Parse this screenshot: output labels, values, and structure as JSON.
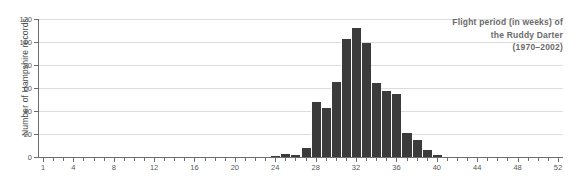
{
  "chart_data": {
    "type": "bar",
    "title": "Flight period (in weeks) of the Ruddy Darter (1970–2002)",
    "title_lines": [
      "Flight period (in weeks) of",
      "the Ruddy Darter",
      "(1970–2002)"
    ],
    "xlabel": "",
    "ylabel": "Number of Hampshire records",
    "xlim": [
      0.5,
      52.5
    ],
    "ylim": [
      0,
      120
    ],
    "grid": true,
    "legend": false,
    "bar_color": "#3b3b3b",
    "axis_color": "#6d6d6d",
    "grid_color": "#dcdcdc",
    "title_color": "#6a6a6a",
    "ytick_values": [
      0,
      20,
      40,
      60,
      80,
      100,
      120
    ],
    "ytick_labels": [
      "0",
      "20",
      "40",
      "60",
      "80",
      "100",
      "120"
    ],
    "xtick_values": [
      1,
      4,
      8,
      12,
      16,
      20,
      24,
      28,
      32,
      36,
      40,
      44,
      48,
      52
    ],
    "xtick_labels": [
      "1",
      "4",
      "8",
      "12",
      "16",
      "20",
      "24",
      "28",
      "32",
      "36",
      "40",
      "44",
      "48",
      "52"
    ],
    "categories": [
      1,
      2,
      3,
      4,
      5,
      6,
      7,
      8,
      9,
      10,
      11,
      12,
      13,
      14,
      15,
      16,
      17,
      18,
      19,
      20,
      21,
      22,
      23,
      24,
      25,
      26,
      27,
      28,
      29,
      30,
      31,
      32,
      33,
      34,
      35,
      36,
      37,
      38,
      39,
      40,
      41,
      42,
      43,
      44,
      45,
      46,
      47,
      48,
      49,
      50,
      51,
      52
    ],
    "values": [
      0,
      0,
      0,
      0,
      0,
      0,
      0,
      0,
      0,
      0,
      0,
      0,
      0,
      0,
      0,
      0,
      0,
      0,
      0,
      0,
      0,
      0,
      0,
      1,
      3,
      2,
      8,
      48,
      43,
      65,
      103,
      112,
      99,
      64,
      57,
      55,
      21,
      15,
      6,
      2,
      0,
      0,
      0,
      0,
      0,
      0,
      0,
      0,
      0,
      0,
      0,
      0
    ]
  }
}
